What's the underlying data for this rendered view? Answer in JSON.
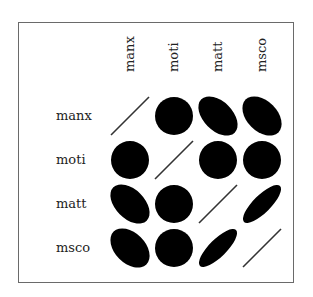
{
  "chart_data": {
    "type": "correlation-ellipse-matrix",
    "title": "",
    "variables": [
      "manx",
      "moti",
      "matt",
      "msco"
    ],
    "row_labels": [
      "manx",
      "moti",
      "matt",
      "msco"
    ],
    "column_labels": [
      "manx",
      "moti",
      "matt",
      "msco"
    ],
    "matrix": [
      [
        1.0,
        0.0,
        -0.45,
        -0.4
      ],
      [
        0.0,
        1.0,
        0.0,
        0.0
      ],
      [
        -0.45,
        0.0,
        1.0,
        0.8
      ],
      [
        -0.4,
        0.0,
        0.8,
        1.0
      ]
    ],
    "diagonal": "line",
    "fill_color": "#000000",
    "grid": false,
    "legend": "none"
  },
  "labels": {
    "rows": [
      "manx",
      "moti",
      "matt",
      "msco"
    ],
    "cols": [
      "manx",
      "moti",
      "matt",
      "msco"
    ]
  }
}
